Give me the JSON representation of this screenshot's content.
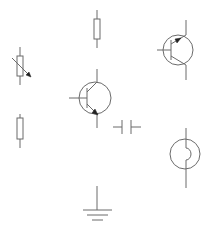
{
  "diagram": {
    "type": "electronic-schematic-symbols",
    "background": "#ffffff",
    "stroke_color": "#6b6b6b",
    "arrow_color": "#222222",
    "components": [
      {
        "id": "variable-resistor",
        "label": "Variable resistor"
      },
      {
        "id": "resistor-top",
        "label": "Resistor"
      },
      {
        "id": "npn-transistor",
        "label": "NPN transistor"
      },
      {
        "id": "pnp-transistor",
        "label": "PNP transistor"
      },
      {
        "id": "resistor-lower",
        "label": "Resistor"
      },
      {
        "id": "capacitor",
        "label": "Capacitor"
      },
      {
        "id": "lamp",
        "label": "Lamp / bulb"
      },
      {
        "id": "ground",
        "label": "Ground"
      }
    ]
  }
}
